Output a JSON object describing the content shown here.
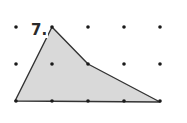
{
  "problem": {
    "number_label": "7."
  },
  "grid": {
    "columns_x": [
      16,
      52,
      88,
      124,
      160
    ],
    "rows_y": [
      27,
      64,
      101
    ],
    "dot_color": "#1a1a1a"
  },
  "polygon": {
    "vertices": [
      [
        52,
        27
      ],
      [
        88,
        64
      ],
      [
        160,
        102
      ],
      [
        15,
        101
      ]
    ],
    "fill": "#d9d9d9",
    "stroke": "#333333"
  }
}
